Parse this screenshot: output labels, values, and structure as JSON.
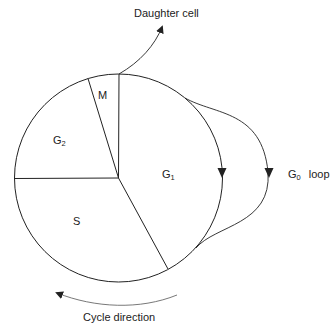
{
  "diagram": {
    "type": "cell-cycle",
    "phases": [
      {
        "id": "M",
        "label": "M",
        "sub": ""
      },
      {
        "id": "G1",
        "label": "G",
        "sub": "1"
      },
      {
        "id": "S",
        "label": "S",
        "sub": ""
      },
      {
        "id": "G2",
        "label": "G",
        "sub": "2"
      }
    ],
    "annotations": {
      "daughter_cell": "Daughter cell",
      "g0_loop_prefix": "G",
      "g0_loop_sub": "0",
      "g0_loop_suffix": "loop",
      "cycle_direction": "Cycle direction"
    },
    "colors": {
      "stroke": "#222222",
      "background": "#ffffff"
    }
  }
}
